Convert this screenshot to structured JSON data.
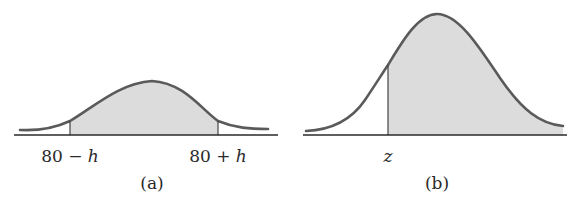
{
  "figure": {
    "panels": [
      {
        "id": "a",
        "caption": "(a)",
        "left_label_num": "80 − ",
        "left_label_var": "h",
        "right_label_num": "80 + ",
        "right_label_var": "h",
        "shaded_region": "between 80 − h and 80 + h"
      },
      {
        "id": "b",
        "caption": "(b)",
        "label_var": "z",
        "shaded_region": "to the right of z"
      }
    ],
    "colors": {
      "curve": "#5a5a5a",
      "axis": "#2a2a2a",
      "shade": "#dcdcdc",
      "text": "#2a2a2a"
    }
  }
}
